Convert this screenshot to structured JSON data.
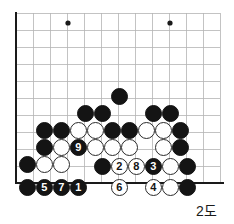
{
  "figure": {
    "kind": "go-board-diagram",
    "caption": "2도",
    "caption_x": 196,
    "caption_y": 200
  },
  "board": {
    "origin_x": 16,
    "origin_y": 13,
    "spacing": 17,
    "cols": 13,
    "rows": 11,
    "stone_diameter": 17,
    "line_color": "#b4b4b4",
    "edge_color": "#1a1a1a",
    "edge_width": 2.6,
    "grid_width": 0.8,
    "left_edge_col": 0,
    "bottom_edge_row": 10,
    "star_points": [
      {
        "x": 68,
        "y": 23,
        "r": 2.6
      },
      {
        "x": 170,
        "y": 23,
        "r": 2.6
      }
    ]
  },
  "stones": [
    {
      "color": "black",
      "x": 119,
      "y": 96,
      "label": ""
    },
    {
      "color": "black",
      "x": 85,
      "y": 113,
      "label": ""
    },
    {
      "color": "black",
      "x": 102,
      "y": 113,
      "label": ""
    },
    {
      "color": "black",
      "x": 153,
      "y": 113,
      "label": ""
    },
    {
      "color": "black",
      "x": 170,
      "y": 113,
      "label": ""
    },
    {
      "color": "black",
      "x": 44,
      "y": 130,
      "label": ""
    },
    {
      "color": "black",
      "x": 61,
      "y": 130,
      "label": ""
    },
    {
      "color": "white",
      "x": 78,
      "y": 130,
      "label": ""
    },
    {
      "color": "white",
      "x": 95,
      "y": 130,
      "label": ""
    },
    {
      "color": "black",
      "x": 112,
      "y": 130,
      "label": ""
    },
    {
      "color": "black",
      "x": 129,
      "y": 130,
      "label": ""
    },
    {
      "color": "white",
      "x": 146,
      "y": 130,
      "label": ""
    },
    {
      "color": "white",
      "x": 163,
      "y": 130,
      "label": ""
    },
    {
      "color": "black",
      "x": 180,
      "y": 130,
      "label": ""
    },
    {
      "color": "black",
      "x": 44,
      "y": 147,
      "label": ""
    },
    {
      "color": "white",
      "x": 61,
      "y": 147,
      "label": ""
    },
    {
      "color": "black",
      "x": 78,
      "y": 147,
      "label": "9"
    },
    {
      "color": "white",
      "x": 95,
      "y": 147,
      "label": ""
    },
    {
      "color": "white",
      "x": 112,
      "y": 147,
      "label": ""
    },
    {
      "color": "white",
      "x": 129,
      "y": 147,
      "label": ""
    },
    {
      "color": "white",
      "x": 163,
      "y": 147,
      "label": ""
    },
    {
      "color": "black",
      "x": 180,
      "y": 147,
      "label": ""
    },
    {
      "color": "black",
      "x": 27,
      "y": 164,
      "label": ""
    },
    {
      "color": "white",
      "x": 44,
      "y": 164,
      "label": ""
    },
    {
      "color": "white",
      "x": 61,
      "y": 164,
      "label": ""
    },
    {
      "color": "black",
      "x": 102,
      "y": 166,
      "label": ""
    },
    {
      "color": "white",
      "x": 119,
      "y": 166,
      "label": "2"
    },
    {
      "color": "white",
      "x": 136,
      "y": 166,
      "label": "8"
    },
    {
      "color": "black",
      "x": 153,
      "y": 166,
      "label": "3"
    },
    {
      "color": "white",
      "x": 170,
      "y": 166,
      "label": ""
    },
    {
      "color": "black",
      "x": 187,
      "y": 166,
      "label": ""
    },
    {
      "color": "black",
      "x": 27,
      "y": 187,
      "label": ""
    },
    {
      "color": "black",
      "x": 44,
      "y": 187,
      "label": "5"
    },
    {
      "color": "black",
      "x": 61,
      "y": 187,
      "label": "7"
    },
    {
      "color": "black",
      "x": 78,
      "y": 187,
      "label": "1"
    },
    {
      "color": "white",
      "x": 119,
      "y": 187,
      "label": "6"
    },
    {
      "color": "white",
      "x": 153,
      "y": 187,
      "label": "4"
    },
    {
      "color": "white",
      "x": 170,
      "y": 187,
      "label": ""
    },
    {
      "color": "black",
      "x": 187,
      "y": 187,
      "label": ""
    }
  ]
}
